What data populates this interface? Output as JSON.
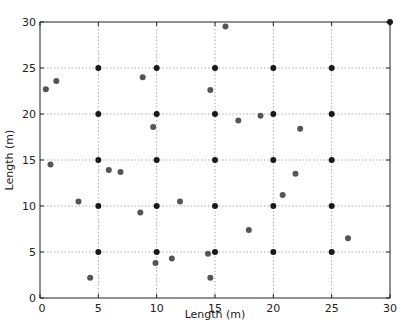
{
  "chart_data": {
    "type": "scatter",
    "title": "",
    "xlabel": "Length (m)",
    "ylabel": "Length (m)",
    "xlim": [
      0,
      30
    ],
    "ylim": [
      0,
      30
    ],
    "xticks": [
      0,
      5,
      10,
      15,
      20,
      25,
      30
    ],
    "yticks": [
      0,
      5,
      10,
      15,
      20,
      25,
      30
    ],
    "grid": true,
    "legend": null,
    "series": [
      {
        "name": "grid-points",
        "color": "#1a1a1a",
        "points": [
          [
            5,
            5
          ],
          [
            5,
            10
          ],
          [
            5,
            15
          ],
          [
            5,
            20
          ],
          [
            5,
            25
          ],
          [
            10,
            5
          ],
          [
            10,
            10
          ],
          [
            10,
            15
          ],
          [
            10,
            20
          ],
          [
            10,
            25
          ],
          [
            15,
            5
          ],
          [
            15,
            10
          ],
          [
            15,
            15
          ],
          [
            15,
            20
          ],
          [
            15,
            25
          ],
          [
            20,
            5
          ],
          [
            20,
            10
          ],
          [
            20,
            15
          ],
          [
            20,
            20
          ],
          [
            20,
            25
          ],
          [
            25,
            5
          ],
          [
            25,
            10
          ],
          [
            25,
            15
          ],
          [
            25,
            20
          ],
          [
            25,
            25
          ],
          [
            30,
            30
          ]
        ]
      },
      {
        "name": "random-points",
        "color": "#555555",
        "points": [
          [
            0.5,
            22.7
          ],
          [
            1.4,
            23.6
          ],
          [
            0.9,
            14.5
          ],
          [
            3.3,
            10.5
          ],
          [
            4.3,
            2.2
          ],
          [
            5.9,
            13.9
          ],
          [
            6.9,
            13.7
          ],
          [
            8.8,
            24.0
          ],
          [
            9.7,
            18.6
          ],
          [
            8.6,
            9.3
          ],
          [
            9.9,
            3.8
          ],
          [
            11.3,
            4.3
          ],
          [
            12.0,
            10.5
          ],
          [
            14.6,
            22.6
          ],
          [
            14.4,
            4.8
          ],
          [
            14.6,
            2.2
          ],
          [
            15.9,
            29.5
          ],
          [
            17.0,
            19.3
          ],
          [
            18.9,
            19.8
          ],
          [
            22.3,
            18.4
          ],
          [
            17.9,
            7.4
          ],
          [
            20.8,
            11.2
          ],
          [
            21.9,
            13.5
          ],
          [
            26.4,
            6.5
          ]
        ]
      }
    ]
  }
}
